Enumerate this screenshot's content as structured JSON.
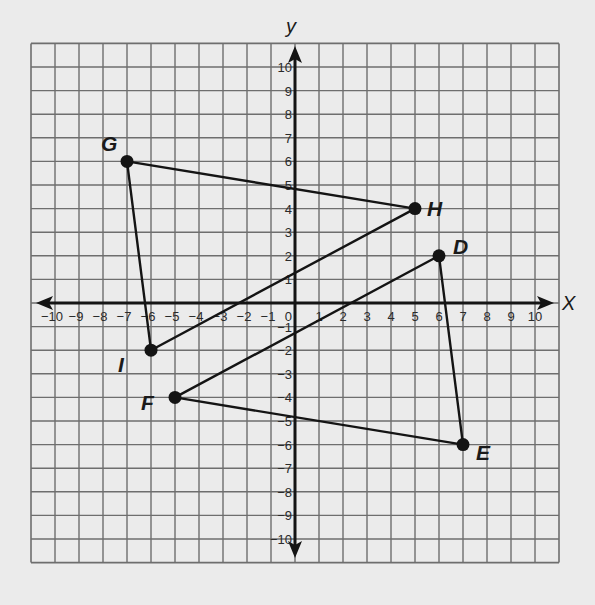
{
  "chart_data": {
    "type": "scatter",
    "title": "",
    "xlabel": "x",
    "ylabel": "y",
    "xlim": [
      -11,
      11
    ],
    "ylim": [
      -11,
      11
    ],
    "grid": true,
    "x_ticks": [
      -10,
      -9,
      -8,
      -7,
      -6,
      -5,
      -4,
      -3,
      -2,
      -1,
      1,
      2,
      3,
      4,
      5,
      6,
      7,
      8,
      9,
      10
    ],
    "y_ticks": [
      10,
      9,
      8,
      7,
      6,
      5,
      4,
      3,
      2,
      1,
      -1,
      -2,
      -3,
      -4,
      -5,
      -6,
      -7,
      -8,
      -9,
      -10
    ],
    "origin_label": "0",
    "points": [
      {
        "label": "G",
        "x": -7,
        "y": 6
      },
      {
        "label": "H",
        "x": 5,
        "y": 4
      },
      {
        "label": "I",
        "x": -6,
        "y": -2
      },
      {
        "label": "D",
        "x": 6,
        "y": 2
      },
      {
        "label": "E",
        "x": 7,
        "y": -6
      },
      {
        "label": "F",
        "x": -5,
        "y": -4
      }
    ],
    "polygons": [
      {
        "name": "triangle GHI",
        "vertices": [
          "G",
          "H",
          "I"
        ]
      },
      {
        "name": "triangle DEF",
        "vertices": [
          "D",
          "E",
          "F"
        ]
      }
    ]
  },
  "axis_labels": {
    "x": "X",
    "y": "y"
  },
  "colors": {
    "background": "#ebebeb",
    "grid": "#6e6e6e",
    "ink": "#141414"
  }
}
